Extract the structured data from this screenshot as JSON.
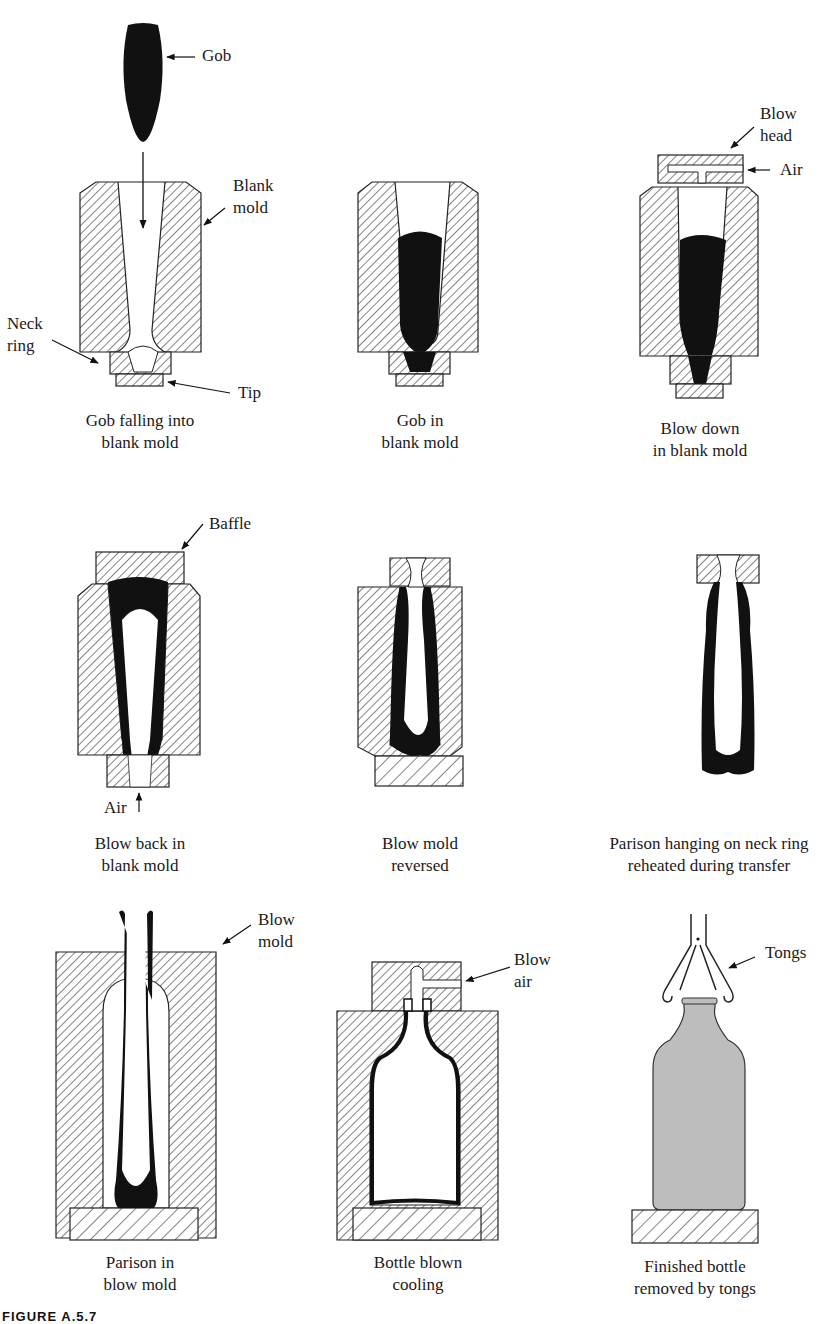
{
  "figure": {
    "caption_label": "FIGURE A.5.7",
    "colors": {
      "glass": "#111111",
      "mold_hatch": "#333333",
      "finished_bottle": "#bdbdbd",
      "background": "#ffffff"
    }
  },
  "panels": [
    {
      "id": "p1",
      "caption_line1": "Gob falling into",
      "caption_line2": "blank mold",
      "labels": {
        "gob": "Gob",
        "blank_mold_1": "Blank",
        "blank_mold_2": "mold",
        "neck_ring_1": "Neck",
        "neck_ring_2": "ring",
        "tip": "Tip"
      }
    },
    {
      "id": "p2",
      "caption_line1": "Gob in",
      "caption_line2": "blank mold"
    },
    {
      "id": "p3",
      "caption_line1": "Blow down",
      "caption_line2": "in blank mold",
      "labels": {
        "blow_head_1": "Blow",
        "blow_head_2": "head",
        "air": "Air"
      }
    },
    {
      "id": "p4",
      "caption_line1": "Blow back in",
      "caption_line2": "blank mold",
      "labels": {
        "baffle": "Baffle",
        "air": "Air"
      }
    },
    {
      "id": "p5",
      "caption_line1": "Blow mold",
      "caption_line2": "reversed"
    },
    {
      "id": "p6",
      "caption_line1": "Parison hanging on neck ring",
      "caption_line2": "reheated during transfer"
    },
    {
      "id": "p7",
      "caption_line1": "Parison in",
      "caption_line2": "blow mold",
      "labels": {
        "blow_mold_1": "Blow",
        "blow_mold_2": "mold"
      }
    },
    {
      "id": "p8",
      "caption_line1": "Bottle blown",
      "caption_line2": "cooling",
      "labels": {
        "blow_air_1": "Blow",
        "blow_air_2": "air"
      }
    },
    {
      "id": "p9",
      "caption_line1": "Finished bottle",
      "caption_line2": "removed by tongs",
      "labels": {
        "tongs": "Tongs"
      }
    }
  ]
}
